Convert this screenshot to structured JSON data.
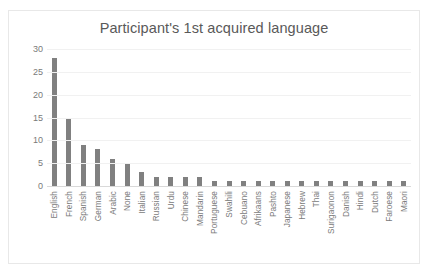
{
  "chart_data": {
    "type": "bar",
    "title": "Participant's 1st acquired language",
    "xlabel": "",
    "ylabel": "",
    "ylim": [
      0,
      30
    ],
    "yticks": [
      30,
      25,
      20,
      15,
      10,
      5,
      0
    ],
    "grid": true,
    "legend": "none",
    "bar_color": "#808080",
    "categories": [
      "English",
      "French",
      "Spanish",
      "German",
      "Arabic",
      "None",
      "Italian",
      "Russian",
      "Urdu",
      "Chinese",
      "Mandarin",
      "Portuguese",
      "Swahili",
      "Cebuano",
      "Afrikaans",
      "Pashto",
      "Japanese",
      "Hebrew",
      "Thai",
      "Surigaonon",
      "Danish",
      "Hindi",
      "Dutch",
      "Faroese",
      "Maori"
    ],
    "values": [
      28,
      15,
      9,
      8,
      6,
      5,
      3,
      2,
      2,
      2,
      2,
      1,
      1,
      1,
      1,
      1,
      1,
      1,
      1,
      1,
      1,
      1,
      1,
      1,
      1
    ]
  },
  "colors": {
    "bar": "#808080",
    "gridline": "#f1f1f1",
    "axis": "#d9d9d9",
    "text": "#7a7a7a",
    "title": "#595959",
    "border": "#e8e8e8"
  }
}
